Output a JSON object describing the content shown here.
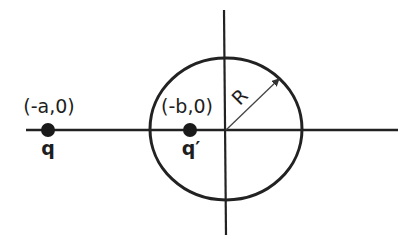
{
  "figure": {
    "type": "method-of-images-diagram",
    "colors": {
      "stroke": "#222222",
      "background": "#ffffff",
      "charge": "#1a1a1a"
    }
  },
  "axes": {
    "horizontal": "x-axis",
    "vertical": "y-axis"
  },
  "circle": {
    "label": "R"
  },
  "charges": [
    {
      "id": "q",
      "position_label": "(-a,0)",
      "charge_label": "q"
    },
    {
      "id": "q_prime",
      "position_label": "(-b,0)",
      "charge_label": "q′"
    }
  ]
}
